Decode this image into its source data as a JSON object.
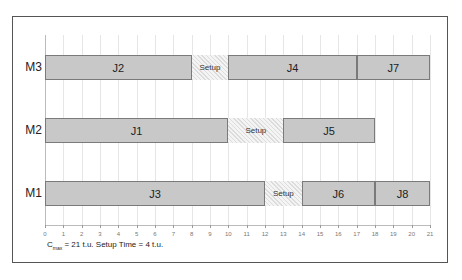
{
  "chart_data": {
    "type": "gantt",
    "title": "",
    "xlabel": "",
    "ylabel": "",
    "xlim": [
      0,
      21
    ],
    "x_ticks": [
      0,
      1,
      2,
      3,
      4,
      5,
      6,
      7,
      8,
      9,
      10,
      11,
      12,
      13,
      14,
      15,
      16,
      17,
      18,
      19,
      20,
      21
    ],
    "grid": true,
    "machines": [
      "M3",
      "M2",
      "M1"
    ],
    "rows": [
      {
        "machine": "M3",
        "tasks": [
          {
            "label": "J2",
            "start": 0,
            "end": 8,
            "kind": "job"
          },
          {
            "label": "Setup",
            "start": 8,
            "end": 10,
            "kind": "setup"
          },
          {
            "label": "J4",
            "start": 10,
            "end": 17,
            "kind": "job"
          },
          {
            "label": "J7",
            "start": 17,
            "end": 21,
            "kind": "job"
          }
        ]
      },
      {
        "machine": "M2",
        "tasks": [
          {
            "label": "J1",
            "start": 0,
            "end": 10,
            "kind": "job"
          },
          {
            "label": "Setup",
            "start": 10,
            "end": 13,
            "kind": "setup"
          },
          {
            "label": "J5",
            "start": 13,
            "end": 18,
            "kind": "job"
          }
        ]
      },
      {
        "machine": "M1",
        "tasks": [
          {
            "label": "J3",
            "start": 0,
            "end": 12,
            "kind": "job"
          },
          {
            "label": "Setup",
            "start": 12,
            "end": 14,
            "kind": "setup"
          },
          {
            "label": "J6",
            "start": 14,
            "end": 18,
            "kind": "job"
          },
          {
            "label": "J8",
            "start": 18,
            "end": 21,
            "kind": "job"
          }
        ]
      }
    ],
    "annotation": {
      "cmax_symbol": "C",
      "cmax_sub": "max",
      "text": " = 21 t.u. Setup Time = 4 t.u."
    },
    "colors": {
      "job": "#c8c8c8",
      "job_border": "#7a7a7a",
      "setup": "#f4f4f4"
    }
  }
}
